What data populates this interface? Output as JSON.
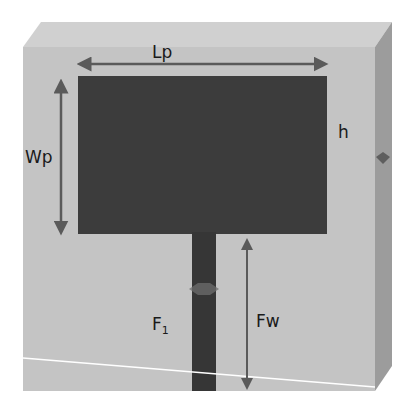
{
  "figure": {
    "colors": {
      "background": "#ffffff",
      "substrate_front": "#c4c4c4",
      "substrate_top": "#d0d0d0",
      "substrate_side": "#9c9c9c",
      "patch": "#3c3c3c",
      "feed": "#363636",
      "arrow": "#5a5a5a",
      "ground_line": "#ffffff"
    },
    "components": [
      {
        "id": "substrate",
        "label": "h",
        "description": "Dielectric substrate (thickness h)"
      },
      {
        "id": "patch",
        "description": "Rectangular radiating patch"
      },
      {
        "id": "feed_line",
        "label": "F1",
        "description": "Microstrip feed line"
      }
    ],
    "dimensions": [
      {
        "id": "Lp",
        "label": "Lp",
        "meaning": "Patch length",
        "orientation": "horizontal"
      },
      {
        "id": "Wp",
        "label": "Wp",
        "meaning": "Patch width",
        "orientation": "vertical"
      },
      {
        "id": "Fw",
        "label": "Fw",
        "meaning": "Feed length",
        "orientation": "vertical"
      },
      {
        "id": "h",
        "label": "h",
        "meaning": "Substrate height"
      }
    ],
    "labels": {
      "Lp": "Lp",
      "Wp": "Wp",
      "h": "h",
      "F_main": "F",
      "F_sub": "1",
      "Fw": "Fw"
    }
  }
}
